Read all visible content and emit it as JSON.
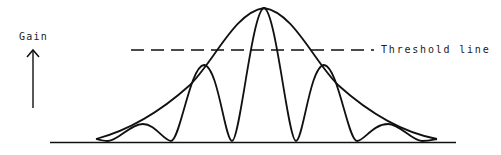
{
  "diagram": {
    "type": "antenna-gain-pattern",
    "axis": {
      "y_label": "Gain",
      "direction_icon": "up-arrow-icon"
    },
    "threshold": {
      "label": "Threshold line",
      "style": "dashed"
    },
    "curves": [
      {
        "name": "envelope",
        "description": "Smooth bell-shaped envelope curve"
      },
      {
        "name": "lobe-pattern",
        "description": "Oscillating main lobe and side lobes under the envelope"
      }
    ],
    "lobes": {
      "main_lobe_count": 1,
      "side_lobes_per_side": 2,
      "first_side_lobes_exceed_threshold": false
    },
    "colors": {
      "stroke": "#111111",
      "background": "#ffffff"
    }
  }
}
